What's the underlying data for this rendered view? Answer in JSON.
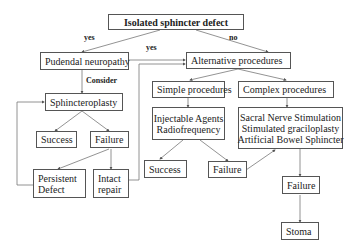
{
  "diagram": {
    "nodes": {
      "root": "Isolated sphincter defect",
      "pudendal": "Pudendal neuropathy",
      "alternative": "Alternative procedures",
      "sphincteroplasty": "Sphincteroplasty",
      "simple": "Simple procedures",
      "complex": "Complex procedures",
      "simple_options": [
        "Injectable Agents",
        "Radiofrequency"
      ],
      "complex_options": [
        "Sacral Nerve Stimulation",
        "Stimulated graciloplasty",
        "Artificial Bowel Sphincter"
      ],
      "sp_success": "Success",
      "sp_failure": "Failure",
      "persistent_defect": [
        "Persistent",
        "Defect"
      ],
      "intact_repair": [
        "Intact",
        "repair"
      ],
      "simple_success": "Success",
      "simple_failure": "Failure",
      "complex_failure": "Failure",
      "stoma": "Stoma"
    },
    "edge_labels": {
      "root_to_pudendal": "yes",
      "pudendal_to_alternative": "yes",
      "root_to_alternative": "no",
      "pudendal_to_sphincteroplasty": "Consider"
    }
  }
}
